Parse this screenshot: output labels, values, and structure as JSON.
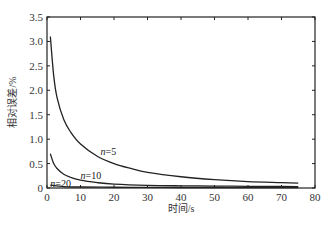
{
  "chart_data": {
    "type": "line",
    "title": "",
    "xlabel": "时间/s",
    "ylabel": "相对误差/%",
    "xlim": [
      0,
      80
    ],
    "ylim": [
      0,
      3.5
    ],
    "xticks": [
      0,
      10,
      20,
      30,
      40,
      50,
      60,
      70,
      80
    ],
    "yticks": [
      0,
      0.5,
      1.0,
      1.5,
      2.0,
      2.5,
      3.0,
      3.5
    ],
    "xtick_labels": [
      "0",
      "10",
      "20",
      "30",
      "40",
      "50",
      "60",
      "70",
      "80"
    ],
    "ytick_labels": [
      "0",
      "0.5",
      "1.0",
      "1.5",
      "2.0",
      "2.5",
      "3.0",
      "3.5"
    ],
    "grid": false,
    "legend": "inline labels",
    "series": [
      {
        "name": "n=5",
        "label_prefix": "n",
        "label_suffix": "=5",
        "x": [
          1,
          2,
          3,
          5,
          7,
          10,
          15,
          20,
          25,
          30,
          40,
          50,
          60,
          70,
          75
        ],
        "values": [
          3.1,
          2.3,
          1.85,
          1.4,
          1.15,
          0.9,
          0.65,
          0.5,
          0.4,
          0.32,
          0.23,
          0.17,
          0.13,
          0.11,
          0.1
        ]
      },
      {
        "name": "n=10",
        "label_prefix": "n",
        "label_suffix": "=10",
        "x": [
          1,
          2,
          3,
          5,
          7,
          10,
          15,
          20,
          30,
          40,
          50,
          60,
          70,
          75
        ],
        "values": [
          0.7,
          0.5,
          0.4,
          0.28,
          0.22,
          0.16,
          0.11,
          0.08,
          0.055,
          0.045,
          0.04,
          0.035,
          0.032,
          0.03
        ]
      },
      {
        "name": "n=20",
        "label_prefix": "n",
        "label_suffix": "=20",
        "x": [
          1,
          5,
          10,
          20,
          30,
          40,
          50,
          60,
          70,
          75
        ],
        "values": [
          0.06,
          0.03,
          0.02,
          0.015,
          0.012,
          0.01,
          0.01,
          0.008,
          0.008,
          0.008
        ]
      }
    ],
    "annotations": [
      {
        "text": "n=5",
        "x": 16,
        "y": 0.68
      },
      {
        "text": "n=10",
        "x": 10,
        "y": 0.18
      },
      {
        "text": "n=20",
        "x": 1,
        "y": 0.03
      }
    ]
  }
}
